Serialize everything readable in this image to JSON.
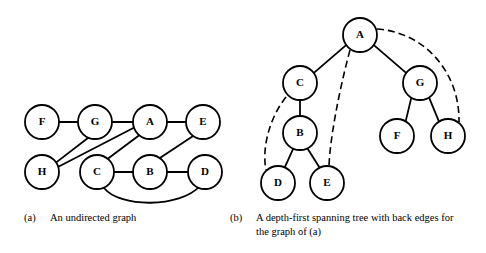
{
  "figure": {
    "background_color": "#ffffff",
    "ink_color": "#000000"
  },
  "panels": [
    {
      "id": "panel-a",
      "tag": "(a)",
      "caption": "An undirected graph",
      "type": "undirected-graph",
      "node_radius": 17,
      "nodes": [
        {
          "id": "F",
          "label": "F",
          "cx": 42,
          "cy": 122
        },
        {
          "id": "G",
          "label": "G",
          "cx": 95,
          "cy": 122
        },
        {
          "id": "A",
          "label": "A",
          "cx": 150,
          "cy": 122
        },
        {
          "id": "E",
          "label": "E",
          "cx": 203,
          "cy": 122
        },
        {
          "id": "H",
          "label": "H",
          "cx": 42,
          "cy": 172
        },
        {
          "id": "C",
          "label": "C",
          "cx": 97,
          "cy": 172
        },
        {
          "id": "B",
          "label": "B",
          "cx": 150,
          "cy": 172
        },
        {
          "id": "D",
          "label": "D",
          "cx": 205,
          "cy": 172
        }
      ],
      "edges": [
        {
          "from": "F",
          "to": "G",
          "style": "straight"
        },
        {
          "from": "G",
          "to": "A",
          "style": "straight"
        },
        {
          "from": "A",
          "to": "E",
          "style": "straight"
        },
        {
          "from": "G",
          "to": "H",
          "style": "straight"
        },
        {
          "from": "A",
          "to": "H",
          "style": "straight"
        },
        {
          "from": "A",
          "to": "C",
          "style": "straight"
        },
        {
          "from": "E",
          "to": "B",
          "style": "straight"
        },
        {
          "from": "C",
          "to": "B",
          "style": "straight"
        },
        {
          "from": "B",
          "to": "D",
          "style": "straight"
        },
        {
          "from": "C",
          "to": "D",
          "style": "curve-below"
        }
      ]
    },
    {
      "id": "panel-b",
      "tag": "(b)",
      "caption": "A depth-first spanning tree with back edges for the graph of (a)",
      "type": "spanning-tree",
      "node_radius": 17,
      "nodes": [
        {
          "id": "A",
          "label": "A",
          "cx": 360,
          "cy": 35
        },
        {
          "id": "C",
          "label": "C",
          "cx": 300,
          "cy": 83
        },
        {
          "id": "G",
          "label": "G",
          "cx": 420,
          "cy": 83
        },
        {
          "id": "B",
          "label": "B",
          "cx": 300,
          "cy": 133
        },
        {
          "id": "F",
          "label": "F",
          "cx": 397,
          "cy": 136
        },
        {
          "id": "H",
          "label": "H",
          "cx": 448,
          "cy": 136
        },
        {
          "id": "D",
          "label": "D",
          "cx": 278,
          "cy": 183
        },
        {
          "id": "E",
          "label": "E",
          "cx": 327,
          "cy": 183
        }
      ],
      "tree_edges": [
        {
          "from": "A",
          "to": "C"
        },
        {
          "from": "A",
          "to": "G"
        },
        {
          "from": "C",
          "to": "B"
        },
        {
          "from": "B",
          "to": "D"
        },
        {
          "from": "B",
          "to": "E"
        },
        {
          "from": "G",
          "to": "F"
        },
        {
          "from": "G",
          "to": "H"
        }
      ],
      "back_edges": [
        {
          "from": "C",
          "to": "D"
        },
        {
          "from": "A",
          "to": "E"
        },
        {
          "from": "A",
          "to": "H"
        }
      ]
    }
  ]
}
